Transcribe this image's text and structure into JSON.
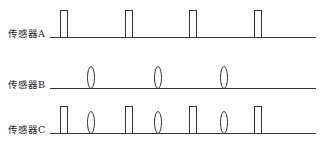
{
  "rows": [
    {
      "label": "传感器A",
      "baseline_y": 37,
      "pulses": [
        60,
        125,
        189,
        254
      ],
      "ellipses": []
    },
    {
      "label": "传感器B",
      "baseline_y": 88,
      "pulses": [],
      "ellipses": [
        91,
        158,
        224
      ]
    },
    {
      "label": "传感器C",
      "baseline_y": 133,
      "pulses": [
        60,
        125,
        189,
        254
      ],
      "ellipses": [
        91,
        158,
        224
      ]
    }
  ],
  "line_start_x": 50,
  "line_end_x": 316,
  "pulse_width": 7,
  "pulse_height": 27,
  "ellipse_rx": 3.5,
  "ellipse_ry": 11,
  "stroke_color": "#333333"
}
